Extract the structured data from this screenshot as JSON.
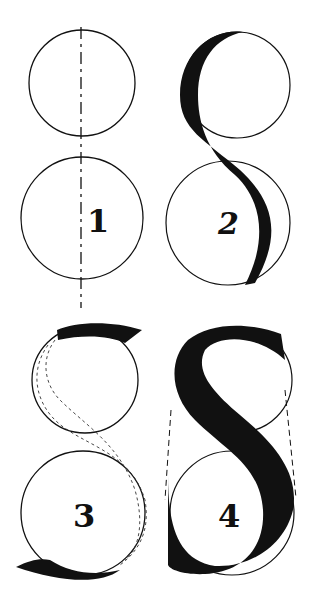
{
  "colors": {
    "ink": "#111111",
    "paper": "#ffffff"
  },
  "panels": [
    {
      "step": "1",
      "description": "Two stacked circles on a vertical dashed axis"
    },
    {
      "step": "2",
      "description": "S stroke drawn around the circles"
    },
    {
      "step": "3",
      "description": "Dashed S outline with terminals"
    },
    {
      "step": "4",
      "description": "Finished heavy S with dashed guide lines"
    }
  ]
}
